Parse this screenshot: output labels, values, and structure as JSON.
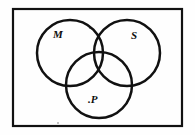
{
  "figure": {
    "kind": "venn-diagram",
    "background_color": "#fefefe",
    "ink_color": "#111111",
    "border": {
      "x": 12,
      "y": 8,
      "width": 171,
      "height": 119,
      "stroke_width": 2,
      "color": "#111111"
    },
    "circles": [
      {
        "name": "circle-m",
        "label": "M",
        "cx": 70,
        "cy": 53,
        "r": 33,
        "stroke_width": 2.4,
        "color": "#111111"
      },
      {
        "name": "circle-s",
        "label": "S",
        "cx": 127,
        "cy": 53,
        "r": 33,
        "stroke_width": 2.4,
        "color": "#111111"
      },
      {
        "name": "circle-p",
        "label": ".P",
        "cx": 99,
        "cy": 85,
        "r": 33,
        "stroke_width": 2.4,
        "color": "#111111"
      }
    ],
    "labels": {
      "m": "M",
      "s": "S",
      "p": ".P"
    },
    "marks": [
      {
        "name": "speck-top",
        "x": 89,
        "y": 27
      },
      {
        "name": "speck-bottom",
        "x": 57,
        "y": 122
      }
    ]
  }
}
